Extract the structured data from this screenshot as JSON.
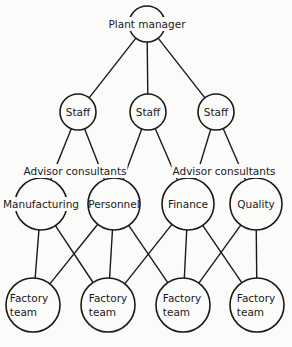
{
  "diagram": {
    "type": "organization-chart",
    "line_color": "#1a1a1a",
    "background": "#fbfbf9",
    "nodes": {
      "plant_manager": {
        "label": "Plant manager",
        "cx": 147,
        "cy": 24,
        "r": 18
      },
      "staff": [
        {
          "label": "Staff",
          "cx": 78,
          "cy": 112,
          "r": 18
        },
        {
          "label": "Staff",
          "cx": 148,
          "cy": 112,
          "r": 18
        },
        {
          "label": "Staff",
          "cx": 216,
          "cy": 112,
          "r": 18
        }
      ],
      "departments": [
        {
          "label": "Manufacturing",
          "cx": 41,
          "cy": 204,
          "r": 26
        },
        {
          "label": "Personnel",
          "cx": 114,
          "cy": 204,
          "r": 26
        },
        {
          "label": "Finance",
          "cx": 188,
          "cy": 204,
          "r": 26
        },
        {
          "label": "Quality",
          "cx": 256,
          "cy": 204,
          "r": 26
        }
      ],
      "factory_teams": [
        {
          "line1": "Factory",
          "line2": "team",
          "cx": 33,
          "cy": 305,
          "r": 27
        },
        {
          "line1": "Factory",
          "line2": "team",
          "cx": 108,
          "cy": 305,
          "r": 27
        },
        {
          "line1": "Factory",
          "line2": "team",
          "cx": 183,
          "cy": 305,
          "r": 27
        },
        {
          "line1": "Factory",
          "line2": "team",
          "cx": 257,
          "cy": 305,
          "r": 27
        }
      ]
    },
    "annotations": [
      {
        "label": "Advisor consultants",
        "x": 75,
        "y": 171
      },
      {
        "label": "Advisor consultants",
        "x": 224,
        "y": 171
      }
    ],
    "edges": [
      [
        "plant_manager",
        "staff.0"
      ],
      [
        "plant_manager",
        "staff.1"
      ],
      [
        "plant_manager",
        "staff.2"
      ],
      [
        "staff.0",
        "departments.0"
      ],
      [
        "staff.0",
        "departments.1"
      ],
      [
        "staff.1",
        "departments.1"
      ],
      [
        "staff.1",
        "departments.2"
      ],
      [
        "staff.2",
        "departments.2"
      ],
      [
        "staff.2",
        "departments.3"
      ],
      [
        "departments.0",
        "factory_teams.0"
      ],
      [
        "departments.0",
        "factory_teams.1"
      ],
      [
        "departments.1",
        "factory_teams.0"
      ],
      [
        "departments.1",
        "factory_teams.1"
      ],
      [
        "departments.1",
        "factory_teams.2"
      ],
      [
        "departments.2",
        "factory_teams.1"
      ],
      [
        "departments.2",
        "factory_teams.2"
      ],
      [
        "departments.2",
        "factory_teams.3"
      ],
      [
        "departments.3",
        "factory_teams.2"
      ],
      [
        "departments.3",
        "factory_teams.3"
      ]
    ]
  }
}
